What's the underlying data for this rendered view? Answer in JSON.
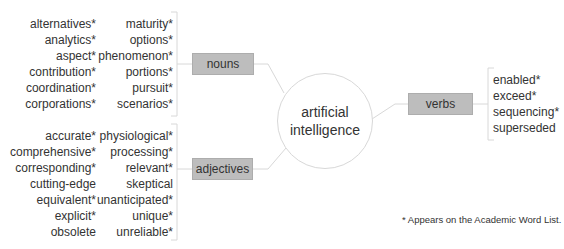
{
  "diagram": {
    "center": {
      "line1": "artificial",
      "line2": "intelligence"
    },
    "branches": {
      "nouns": {
        "label": "nouns",
        "column1": [
          "alternatives*",
          "analytics*",
          "aspect*",
          "contribution*",
          "coordination*",
          "corporations*"
        ],
        "column2": [
          "maturity*",
          "options*",
          "phenomenon*",
          "portions*",
          "pursuit*",
          "scenarios*"
        ]
      },
      "adjectives": {
        "label": "adjectives",
        "column1": [
          "accurate*",
          "comprehensive*",
          "corresponding*",
          "cutting-edge",
          "equivalent*",
          "explicit*",
          "obsolete"
        ],
        "column2": [
          "physiological*",
          "processing*",
          "relevant*",
          "skeptical",
          "unanticipated*",
          "unique*",
          "unreliable*"
        ]
      },
      "verbs": {
        "label": "verbs",
        "column1": [
          "enabled*",
          "exceed*",
          "sequencing*",
          "superseded"
        ]
      }
    },
    "footnote": "* Appears on the Academic Word List.",
    "colors": {
      "box_fill": "#bdbdbd",
      "line": "#d8d8d8",
      "text": "#333333"
    }
  }
}
